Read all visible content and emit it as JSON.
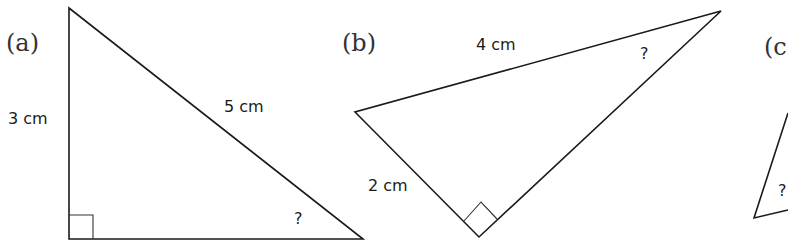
{
  "figure": {
    "background": "#ffffff",
    "line_color": "#1a1a1a",
    "triangles": [
      {
        "id": "a",
        "label": "(a)",
        "vertices": [
          [
            69,
            8
          ],
          [
            69,
            239
          ],
          [
            363,
            239
          ]
        ],
        "right_angle_at": [
          69,
          239
        ],
        "sides": [
          {
            "text": "3 cm",
            "position": "vertical side"
          },
          {
            "text": "5 cm",
            "position": "hypotenuse"
          }
        ],
        "unknown_angle": {
          "text": "?",
          "position": "bottom-right vertex"
        }
      },
      {
        "id": "b",
        "label": "(b)",
        "vertices": [
          [
            355,
            112
          ],
          [
            479,
            237
          ],
          [
            721,
            11
          ]
        ],
        "right_angle_at": [
          479,
          237
        ],
        "sides": [
          {
            "text": "4 cm",
            "position": "top side"
          },
          {
            "text": "2 cm",
            "position": "lower-left side"
          }
        ],
        "unknown_angle": {
          "text": "?",
          "position": "top-right vertex"
        }
      },
      {
        "id": "c",
        "label": "(c",
        "vertices": [
          [
            754,
            218
          ],
          [
            788,
            113
          ],
          [
            788,
            210
          ]
        ],
        "clipped": true,
        "unknown_angle": {
          "text": "?",
          "position": "bottom-left vertex"
        }
      }
    ]
  },
  "labels": {
    "a_part": "(a)",
    "a_side_vertical": "3 cm",
    "a_side_hyp": "5 cm",
    "a_unknown": "?",
    "b_part": "(b)",
    "b_side_top": "4 cm",
    "b_side_left": "2 cm",
    "b_unknown": "?",
    "c_part": "(c",
    "c_unknown": "?"
  }
}
